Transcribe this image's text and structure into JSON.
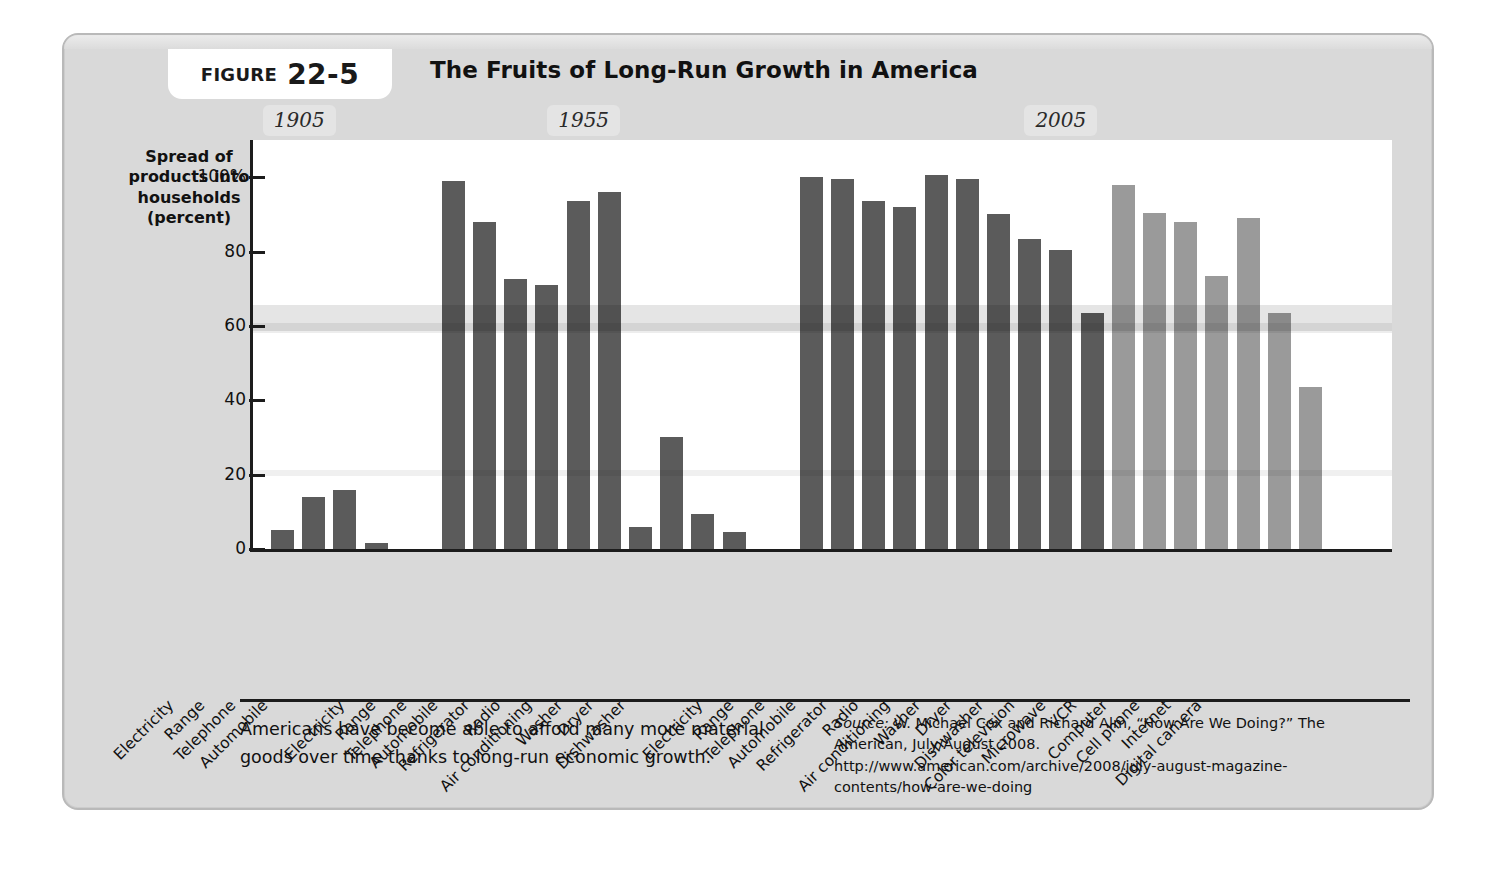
{
  "figure": {
    "label_word": "FIGURE",
    "number": "22-5",
    "title": "The Fruits of Long-Run Growth in America"
  },
  "caption": "Americans have become able to afford many more material goods over time thanks to long-run economic growth.",
  "source": {
    "prefix": "Source:",
    "line1": "W. Michael Cox and Richard Alm, “How Are We Doing?” The",
    "line2": "American, July/August 2008.",
    "line3": "http://www.american.com/archive/2008/july-august-magazine-",
    "line4": "contents/how-are-we-doing"
  },
  "colors": {
    "bar_dark": "#5b5b5b",
    "bar_light": "#9a9a9a",
    "panel": "#d9d9d9",
    "axis": "#1c1c1c",
    "plot_bg": "#ffffff",
    "era_badge": "#e4e4e4"
  },
  "chart_data": {
    "type": "bar",
    "title": "The Fruits of Long-Run Growth in America",
    "xlabel": "",
    "ylabel": "Spread of products into households (percent)",
    "ylabel_lines": [
      "Spread of",
      "products into",
      "households",
      "(percent)"
    ],
    "ylim": [
      0,
      110
    ],
    "yticks": [
      0,
      20,
      40,
      60,
      80,
      100
    ],
    "ytick_labels": [
      "0",
      "20",
      "40",
      "60",
      "80",
      "100%"
    ],
    "grid": false,
    "legend": "none",
    "group_labels": [
      "1905",
      "1955",
      "2005"
    ],
    "groups": [
      {
        "label": "1905",
        "shade": "dark",
        "categories": [
          "Electricity",
          "Range",
          "Telephone",
          "Automobile"
        ],
        "values": [
          5,
          14,
          16,
          1.5
        ]
      },
      {
        "label": "1955",
        "shade": "dark",
        "categories": [
          "Electricity",
          "Range",
          "Telephone",
          "Automobile",
          "Refrigerator",
          "Radio",
          "Air conditioning",
          "Washer",
          "Dryer",
          "Dishwasher"
        ],
        "values": [
          99,
          88,
          72.5,
          71,
          93.5,
          96,
          6,
          30,
          9.5,
          4.5
        ]
      },
      {
        "label": "2005",
        "shade": "mixed",
        "categories": [
          "Electricity",
          "Range",
          "Telephone",
          "Automobile",
          "Refrigerator",
          "Radio",
          "Air conditioning",
          "Washer",
          "Dryer",
          "Dishwasher",
          "Color television",
          "Microwave",
          "VCR",
          "Computer",
          "Cell phone",
          "Internet",
          "Digital camera"
        ],
        "values": [
          100,
          99.5,
          93.5,
          92,
          100.5,
          99.5,
          90,
          83.5,
          80.5,
          63.5,
          98,
          90.5,
          88,
          73.5,
          89,
          63.5,
          43.5
        ],
        "shades": [
          "dark",
          "dark",
          "dark",
          "dark",
          "dark",
          "dark",
          "dark",
          "dark",
          "dark",
          "dark",
          "light",
          "light",
          "light",
          "light",
          "light",
          "light",
          "light"
        ]
      }
    ]
  }
}
